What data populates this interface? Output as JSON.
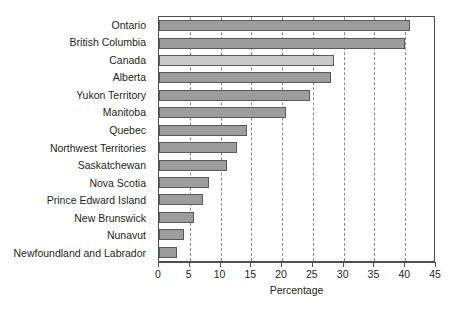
{
  "chart_data": {
    "type": "bar",
    "orientation": "horizontal",
    "title": "",
    "xlabel": "Percentage",
    "ylabel": "",
    "xlim": [
      0,
      45
    ],
    "xticks": [
      0,
      5,
      10,
      15,
      20,
      25,
      30,
      35,
      40,
      45
    ],
    "xticklabels": [
      "0",
      "5",
      "10",
      "15",
      "20",
      "25",
      "30",
      "35",
      "40",
      "45"
    ],
    "grid": "vertical-dashed",
    "legend": "none",
    "categories": [
      "Ontario",
      "British Columbia",
      "Canada",
      "Alberta",
      "Yukon Territory",
      "Manitoba",
      "Quebec",
      "Northwest Territories",
      "Saskatchewan",
      "Nova Scotia",
      "Prince Edward Island",
      "New Brunswick",
      "Nunavut",
      "Newfoundland and Labrador"
    ],
    "values": [
      40.8,
      40.0,
      28.4,
      28.0,
      24.5,
      20.7,
      14.3,
      12.7,
      11.1,
      8.2,
      7.1,
      5.7,
      4.1,
      3.0
    ],
    "bar_styles": [
      "dark",
      "dark",
      "light",
      "dark",
      "dark",
      "dark",
      "dark",
      "dark",
      "dark",
      "dark",
      "dark",
      "dark",
      "dark",
      "dark"
    ],
    "colors": {
      "bar_dark_fill": "#9d9d9d",
      "bar_light_fill": "#c9c9c9",
      "bar_edge": "#595959",
      "axis": "#4d4d4d",
      "gridline": "#8a8a8a",
      "text": "#231f20",
      "background": "#ffffff"
    }
  }
}
